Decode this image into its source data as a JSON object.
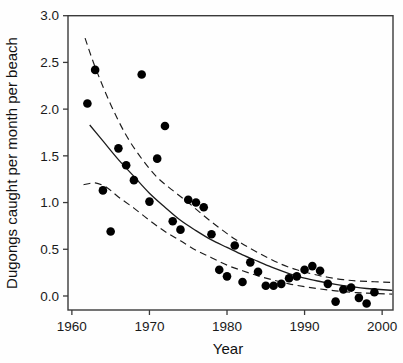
{
  "chart_data": {
    "type": "scatter",
    "title": "",
    "xlabel": "Year",
    "ylabel": "Dugongs caught per month per beach",
    "xlim": [
      1959.5,
      2001.4
    ],
    "ylim": [
      -0.15,
      3.0
    ],
    "grid": false,
    "frame": true,
    "legend": "none",
    "background_color": "#fefefe",
    "frame_color": "#3a3a3a",
    "point_color": "#000000",
    "curve_color": "#1c1c1c",
    "band_dash": "7 4.5",
    "x_ticks": [
      {
        "value": 1960,
        "label": "1960"
      },
      {
        "value": 1970,
        "label": "1970"
      },
      {
        "value": 1980,
        "label": "1980"
      },
      {
        "value": 1990,
        "label": "1990"
      },
      {
        "value": 2000,
        "label": "2000"
      }
    ],
    "y_ticks": [
      {
        "value": 0.0,
        "label": "0.0"
      },
      {
        "value": 0.5,
        "label": "0.5"
      },
      {
        "value": 1.0,
        "label": "1.0"
      },
      {
        "value": 1.5,
        "label": "1.5"
      },
      {
        "value": 2.0,
        "label": "2.0"
      },
      {
        "value": 2.5,
        "label": "2.5"
      },
      {
        "value": 3.0,
        "label": "3.0"
      }
    ],
    "series": [
      {
        "name": "observed-catches",
        "kind": "scatter",
        "marker": "filled-circle",
        "marker_radius": 4.3,
        "points": [
          [
            1962,
            2.06
          ],
          [
            1963,
            2.42
          ],
          [
            1964,
            1.13
          ],
          [
            1965,
            0.69
          ],
          [
            1966,
            1.58
          ],
          [
            1967,
            1.4
          ],
          [
            1968,
            1.24
          ],
          [
            1969,
            2.37
          ],
          [
            1970,
            1.01
          ],
          [
            1971,
            1.47
          ],
          [
            1972,
            1.82
          ],
          [
            1973,
            0.8
          ],
          [
            1974,
            0.71
          ],
          [
            1975,
            1.03
          ],
          [
            1976,
            1.0
          ],
          [
            1977,
            0.95
          ],
          [
            1978,
            0.66
          ],
          [
            1979,
            0.28
          ],
          [
            1980,
            0.21
          ],
          [
            1981,
            0.54
          ],
          [
            1982,
            0.15
          ],
          [
            1983,
            0.36
          ],
          [
            1984,
            0.26
          ],
          [
            1985,
            0.11
          ],
          [
            1986,
            0.11
          ],
          [
            1987,
            0.13
          ],
          [
            1988,
            0.19
          ],
          [
            1989,
            0.21
          ],
          [
            1990,
            0.28
          ],
          [
            1991,
            0.32
          ],
          [
            1992,
            0.27
          ],
          [
            1993,
            0.13
          ],
          [
            1994,
            -0.06
          ],
          [
            1995,
            0.07
          ],
          [
            1996,
            0.09
          ],
          [
            1997,
            -0.02
          ],
          [
            1998,
            -0.08
          ],
          [
            1999,
            0.04
          ]
        ]
      },
      {
        "name": "fitted-curve",
        "kind": "line",
        "style": "solid",
        "width": 1.3,
        "points": [
          [
            1962.3,
            1.83
          ],
          [
            1964,
            1.66
          ],
          [
            1966,
            1.46
          ],
          [
            1968,
            1.28
          ],
          [
            1970,
            1.1
          ],
          [
            1972,
            0.95
          ],
          [
            1974,
            0.81
          ],
          [
            1976,
            0.7
          ],
          [
            1978,
            0.6
          ],
          [
            1980,
            0.52
          ],
          [
            1982,
            0.44
          ],
          [
            1984,
            0.37
          ],
          [
            1986,
            0.3
          ],
          [
            1988,
            0.24
          ],
          [
            1990,
            0.19
          ],
          [
            1992,
            0.155
          ],
          [
            1994,
            0.125
          ],
          [
            1996,
            0.1
          ],
          [
            1998,
            0.08
          ],
          [
            2001.3,
            0.06
          ]
        ]
      },
      {
        "name": "upper-confidence-band",
        "kind": "line",
        "style": "dashed",
        "width": 1.15,
        "points": [
          [
            1961.7,
            2.76
          ],
          [
            1963,
            2.45
          ],
          [
            1965,
            2.05
          ],
          [
            1967,
            1.72
          ],
          [
            1969,
            1.47
          ],
          [
            1971,
            1.27
          ],
          [
            1973,
            1.13
          ],
          [
            1975,
            1.0
          ],
          [
            1977,
            0.86
          ],
          [
            1979,
            0.73
          ],
          [
            1981,
            0.61
          ],
          [
            1983,
            0.51
          ],
          [
            1985,
            0.42
          ],
          [
            1987,
            0.34
          ],
          [
            1989,
            0.28
          ],
          [
            1991,
            0.235
          ],
          [
            1993,
            0.2
          ],
          [
            1995,
            0.175
          ],
          [
            1997,
            0.16
          ],
          [
            2001.3,
            0.145
          ]
        ]
      },
      {
        "name": "lower-confidence-band",
        "kind": "line",
        "style": "dashed",
        "width": 1.15,
        "points": [
          [
            1961.5,
            1.19
          ],
          [
            1963,
            1.21
          ],
          [
            1964.5,
            1.16
          ],
          [
            1966,
            1.06
          ],
          [
            1968,
            0.94
          ],
          [
            1970,
            0.81
          ],
          [
            1972,
            0.69
          ],
          [
            1974,
            0.59
          ],
          [
            1976,
            0.49
          ],
          [
            1978,
            0.41
          ],
          [
            1980,
            0.33
          ],
          [
            1982,
            0.27
          ],
          [
            1984,
            0.215
          ],
          [
            1986,
            0.17
          ],
          [
            1988,
            0.13
          ],
          [
            1990,
            0.1
          ],
          [
            1992,
            0.075
          ],
          [
            1994,
            0.055
          ],
          [
            1996,
            0.04
          ],
          [
            1998,
            0.03
          ],
          [
            2001.3,
            0.02
          ]
        ]
      }
    ]
  }
}
